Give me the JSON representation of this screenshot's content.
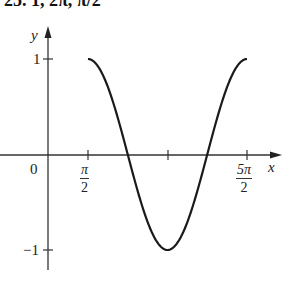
{
  "header": {
    "text": "25. 1, 2π, π/2"
  },
  "axes": {
    "y_label": "y",
    "x_label": "x",
    "origin_label": "0",
    "y_ticks": [
      "1",
      "−1"
    ],
    "x_ticks": [
      {
        "num": "π",
        "den": "2"
      },
      {
        "num": "5π",
        "den": "2"
      }
    ]
  },
  "chart_data": {
    "type": "line",
    "title": "",
    "function": "y = cos(x - π/2 ... ) ; curve of amplitude 1, period 2π, shifted π/2",
    "xlabel": "x",
    "ylabel": "y",
    "x_ticks": [
      "π/2",
      "3π/2",
      "5π/2"
    ],
    "y_ticks": [
      1,
      -1
    ],
    "xlim": [
      0,
      2.6
    ],
    "ylim": [
      -1.2,
      1.2
    ],
    "amplitude": 1,
    "period": "2π",
    "phase_shift": "π/2",
    "points": [
      {
        "x": "π/2",
        "y": 1
      },
      {
        "x": "π",
        "y": 0
      },
      {
        "x": "3π/2",
        "y": -1
      },
      {
        "x": "2π",
        "y": 0
      },
      {
        "x": "5π/2",
        "y": 1
      }
    ],
    "grid": false,
    "legend": null
  }
}
